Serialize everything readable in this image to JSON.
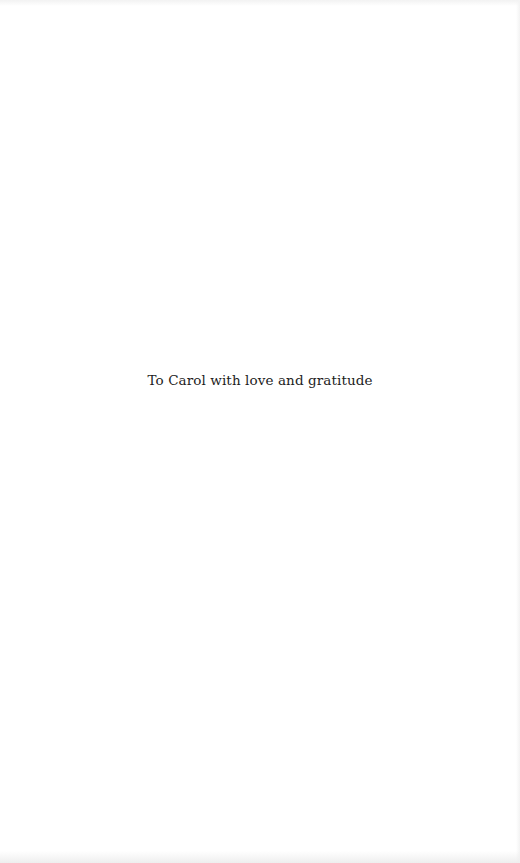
{
  "page": {
    "dedication": "To Carol with love and gratitude",
    "text_color": "#1c1c1c",
    "background_color": "#ffffff"
  }
}
